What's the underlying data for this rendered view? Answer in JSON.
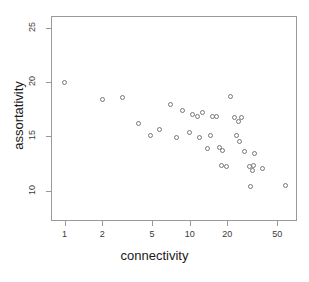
{
  "chart_data": {
    "type": "scatter",
    "title": "",
    "xlabel": "connectivity",
    "ylabel": "assortativity",
    "xscale": "log",
    "yscale": "linear",
    "grid": false,
    "legend": null,
    "xticks": [
      1,
      2,
      5,
      10,
      20,
      50
    ],
    "xticklabels": [
      "1",
      "2",
      "5",
      "10",
      "20",
      "50"
    ],
    "yticks": [
      10,
      15,
      20,
      25
    ],
    "yticklabels": [
      "10",
      "15",
      "20",
      "25"
    ],
    "xlim": [
      0.78,
      72
    ],
    "ylim": [
      7.2,
      26.1
    ],
    "marker": "open-circle",
    "marker_color": "#777777",
    "points": [
      {
        "x": 1.0,
        "y": 20.0
      },
      {
        "x": 2.0,
        "y": 18.4
      },
      {
        "x": 2.9,
        "y": 18.6
      },
      {
        "x": 3.9,
        "y": 16.2
      },
      {
        "x": 4.9,
        "y": 15.1
      },
      {
        "x": 5.7,
        "y": 15.6
      },
      {
        "x": 7.0,
        "y": 17.9
      },
      {
        "x": 7.8,
        "y": 14.9
      },
      {
        "x": 8.8,
        "y": 17.4
      },
      {
        "x": 9.9,
        "y": 15.4
      },
      {
        "x": 10.5,
        "y": 17.0
      },
      {
        "x": 11.6,
        "y": 16.8
      },
      {
        "x": 11.9,
        "y": 14.9
      },
      {
        "x": 12.6,
        "y": 17.2
      },
      {
        "x": 14.0,
        "y": 13.9
      },
      {
        "x": 14.6,
        "y": 15.1
      },
      {
        "x": 15.3,
        "y": 16.8
      },
      {
        "x": 16.5,
        "y": 16.8
      },
      {
        "x": 17.3,
        "y": 14.0
      },
      {
        "x": 18.0,
        "y": 12.3
      },
      {
        "x": 18.3,
        "y": 13.7
      },
      {
        "x": 19.6,
        "y": 12.2
      },
      {
        "x": 21.0,
        "y": 18.7
      },
      {
        "x": 23.0,
        "y": 16.7
      },
      {
        "x": 23.5,
        "y": 15.1
      },
      {
        "x": 24.5,
        "y": 16.4
      },
      {
        "x": 25.0,
        "y": 14.5
      },
      {
        "x": 26.0,
        "y": 16.7
      },
      {
        "x": 27.5,
        "y": 13.6
      },
      {
        "x": 30.0,
        "y": 12.2
      },
      {
        "x": 31.5,
        "y": 11.9
      },
      {
        "x": 32.5,
        "y": 12.3
      },
      {
        "x": 33.0,
        "y": 13.4
      },
      {
        "x": 30.5,
        "y": 10.4
      },
      {
        "x": 38.0,
        "y": 12.0
      },
      {
        "x": 58.0,
        "y": 10.5
      }
    ]
  },
  "axes": {
    "x_title": "connectivity",
    "y_title": "assortativity"
  }
}
